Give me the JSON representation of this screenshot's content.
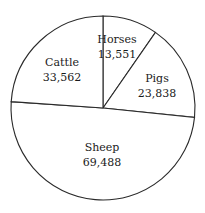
{
  "chart_data": {
    "type": "pie",
    "title": "",
    "start_angle_deg": -90,
    "direction": "clockwise",
    "center": [
      103,
      108
    ],
    "radius": 92,
    "slices": [
      {
        "label": "Horses",
        "value": 13551,
        "display": "13,551",
        "label_pos": [
          117,
          43
        ]
      },
      {
        "label": "Pigs",
        "value": 23838,
        "display": "23,838",
        "label_pos": [
          157,
          82
        ]
      },
      {
        "label": "Sheep",
        "value": 69488,
        "display": "69,488",
        "label_pos": [
          102,
          151
        ]
      },
      {
        "label": "Cattle",
        "value": 33562,
        "display": "33,562",
        "label_pos": [
          62,
          66
        ]
      }
    ],
    "colors": {
      "fill": "#ffffff",
      "stroke": "#2a2a2a",
      "text": "#1a1a1a"
    },
    "legend": "none",
    "grid": false
  }
}
